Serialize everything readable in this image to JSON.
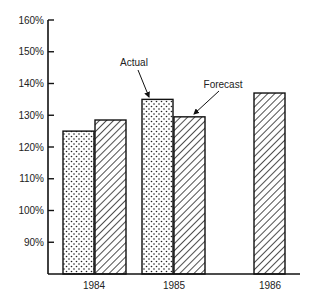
{
  "chart_data": {
    "type": "bar",
    "title": "",
    "xlabel": "",
    "ylabel": "",
    "categories": [
      "1984",
      "1985",
      "1986"
    ],
    "series": [
      {
        "name": "Actual",
        "pattern": "dots",
        "values": [
          125,
          135,
          null
        ]
      },
      {
        "name": "Forecast",
        "pattern": "diagonal-hatch",
        "values": [
          128.5,
          129.5,
          137
        ]
      }
    ],
    "yticks": [
      "90%",
      "100%",
      "110%",
      "120%",
      "130%",
      "140%",
      "150%",
      "160%"
    ],
    "ytick_values": [
      90,
      100,
      110,
      120,
      130,
      140,
      150,
      160
    ],
    "ylim": [
      80,
      160
    ],
    "grid": false,
    "legend": "none",
    "annotations": [
      {
        "text": "Actual",
        "points_to": "1985 Actual bar"
      },
      {
        "text": "Forecast",
        "points_to": "1985 Forecast bar"
      }
    ],
    "colors": {
      "stroke": "#111111",
      "background": "#ffffff"
    }
  }
}
